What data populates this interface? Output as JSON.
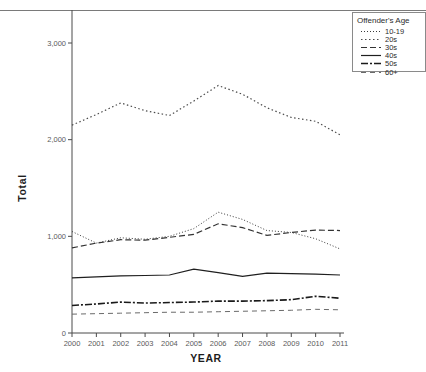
{
  "chart_data": {
    "type": "line",
    "title": "",
    "xlabel": "YEAR",
    "ylabel": "Total",
    "x": [
      2000,
      2001,
      2002,
      2003,
      2004,
      2005,
      2006,
      2007,
      2008,
      2009,
      2010,
      2011
    ],
    "xtick_labels": [
      "2000",
      "2001",
      "2002",
      "2003",
      "2004",
      "2005",
      "2006",
      "2007",
      "2008",
      "2009",
      "2010",
      "2011"
    ],
    "ytick_labels": [
      "0",
      "1,000",
      "2,000",
      "3,000"
    ],
    "ytick_values": [
      0,
      1000,
      2000,
      3000
    ],
    "ylim": [
      0,
      3100
    ],
    "grid": false,
    "legend_position": "top-right",
    "legend_title": "Offender's Age",
    "series": [
      {
        "name": "10-19",
        "dash": "1,2",
        "width": 1.0,
        "color": "#3a3a3a",
        "values": [
          1050,
          930,
          985,
          970,
          1000,
          1080,
          1250,
          1175,
          1060,
          1040,
          975,
          870
        ]
      },
      {
        "name": "20s",
        "dash": "1.5,2.5",
        "width": 1.2,
        "color": "#4a4a4a",
        "values": [
          2150,
          2260,
          2380,
          2300,
          2250,
          2400,
          2560,
          2470,
          2330,
          2230,
          2190,
          2050
        ]
      },
      {
        "name": "30s",
        "dash": "6,3",
        "width": 1.2,
        "color": "#333333",
        "values": [
          880,
          930,
          965,
          960,
          990,
          1020,
          1130,
          1090,
          1010,
          1040,
          1065,
          1060
        ]
      },
      {
        "name": "40s",
        "dash": "none",
        "width": 1.2,
        "color": "#1f1f1f",
        "values": [
          570,
          580,
          590,
          595,
          600,
          660,
          625,
          585,
          620,
          615,
          610,
          600
        ]
      },
      {
        "name": "50s",
        "dash": "7,2,2,2",
        "width": 1.6,
        "color": "#1a1a1a",
        "values": [
          285,
          300,
          320,
          310,
          315,
          320,
          330,
          330,
          335,
          345,
          380,
          360
        ]
      },
      {
        "name": "60+",
        "dash": "5,4",
        "width": 1.0,
        "color": "#6a6a6a",
        "values": [
          195,
          200,
          205,
          210,
          215,
          215,
          220,
          225,
          230,
          235,
          245,
          240
        ]
      }
    ]
  }
}
